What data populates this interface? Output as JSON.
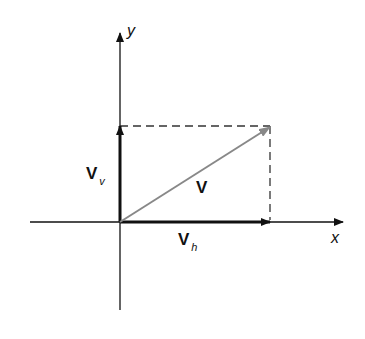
{
  "diagram": {
    "type": "vector-decomposition",
    "axes": {
      "x_label": "x",
      "y_label": "y"
    },
    "vectors": {
      "resultant": {
        "label": "V"
      },
      "horizontal": {
        "label": "V",
        "subscript": "h"
      },
      "vertical": {
        "label": "V",
        "subscript": "v"
      }
    },
    "colors": {
      "axis": "#111111",
      "resultant": "#888888",
      "dashed": "#333333"
    }
  }
}
